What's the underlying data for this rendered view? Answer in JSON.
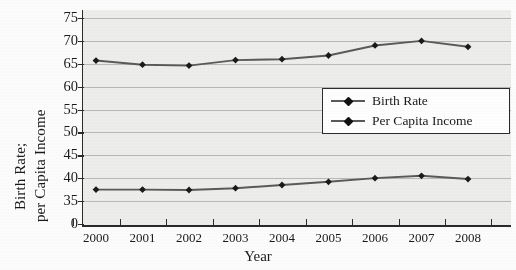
{
  "chart_data": {
    "type": "line",
    "title": "",
    "xlabel": "Year",
    "ylabel": "Birth Rate; per Capita Income",
    "ylabel_line1": "Birth Rate;",
    "ylabel_line2": "per Capita Income",
    "categories": [
      "2000",
      "2001",
      "2002",
      "2003",
      "2004",
      "2005",
      "2006",
      "2007",
      "2008"
    ],
    "yticks": [
      0,
      35,
      40,
      45,
      50,
      55,
      60,
      65,
      70,
      75
    ],
    "ytick_labels": [
      "0",
      "35",
      "40",
      "45",
      "50",
      "55",
      "60",
      "65",
      "70",
      "75"
    ],
    "ylim": [
      30,
      77.5
    ],
    "grid": true,
    "legend_position": "center-right-inside",
    "series": [
      {
        "name": "Birth Rate",
        "marker": "diamond",
        "color": "#1a1a1a",
        "line_color": "#5a5a5a",
        "values": [
          37.5,
          37.5,
          37.4,
          37.8,
          38.5,
          39.2,
          40.0,
          40.5,
          39.8
        ]
      },
      {
        "name": "Per Capita Income",
        "marker": "diamond",
        "color": "#1a1a1a",
        "line_color": "#5a5a5a",
        "values": [
          65.7,
          64.8,
          64.6,
          65.8,
          66.0,
          66.8,
          69.0,
          70.0,
          68.7
        ]
      }
    ],
    "plot_background": "#eeeeec",
    "gridline_color": "#b9b9bb",
    "axis_color": "#2b2b2b"
  },
  "legend": {
    "items": [
      {
        "label": "Birth Rate"
      },
      {
        "label": "Per Capita Income"
      }
    ]
  }
}
